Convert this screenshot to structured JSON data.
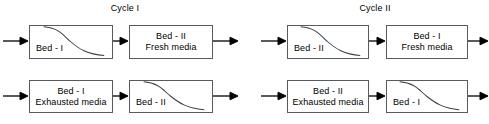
{
  "canvas": {
    "width": 489,
    "height": 124,
    "background": "#ffffff"
  },
  "style": {
    "box_border_color": "#555b5e",
    "curve_color": "#3d4245",
    "arrow_color": "#000000",
    "text_color": "#000000"
  },
  "titles": {
    "cycle_1": "Cycle I",
    "cycle_2": "Cycle II"
  },
  "cycles": [
    {
      "id": "cycle-1",
      "title": "Cycle I",
      "rows": [
        {
          "id": "cycle-1-row-1",
          "boxes": [
            {
              "id": "c1r1b1",
              "label": "Bed - I",
              "has_curve": true,
              "label_position": "lower-left"
            },
            {
              "id": "c1r1b2",
              "label": "Bed - II\nFresh media",
              "has_curve": false,
              "label_position": "centered"
            }
          ]
        },
        {
          "id": "cycle-1-row-2",
          "boxes": [
            {
              "id": "c1r2b1",
              "label": "Bed - I\nExhausted media",
              "has_curve": false,
              "label_position": "centered"
            },
            {
              "id": "c1r2b2",
              "label": "Bed - II",
              "has_curve": true,
              "label_position": "lower-left"
            }
          ]
        }
      ]
    },
    {
      "id": "cycle-2",
      "title": "Cycle II",
      "rows": [
        {
          "id": "cycle-2-row-1",
          "boxes": [
            {
              "id": "c2r1b1",
              "label": "Bed - II",
              "has_curve": true,
              "label_position": "lower-left"
            },
            {
              "id": "c2r1b2",
              "label": "Bed - I\nFresh media",
              "has_curve": false,
              "label_position": "centered"
            }
          ]
        },
        {
          "id": "cycle-2-row-2",
          "boxes": [
            {
              "id": "c2r2b1",
              "label": "Bed - II\nExhausted media",
              "has_curve": false,
              "label_position": "centered"
            },
            {
              "id": "c2r2b2",
              "label": "Bed - I",
              "has_curve": true,
              "label_position": "lower-left"
            }
          ]
        }
      ]
    }
  ],
  "flow_arrows": {
    "count": 12,
    "direction": "right",
    "description": "inlet, inter-bed, and outlet flow arrows"
  }
}
